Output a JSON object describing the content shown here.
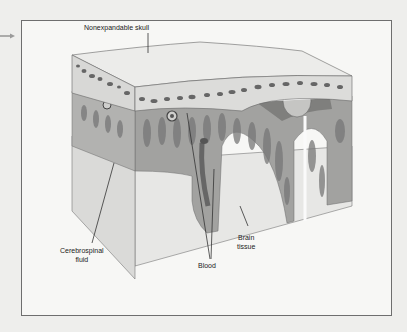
{
  "figure": {
    "type": "anatomical cross-section illustration",
    "labels": {
      "skull": "Nonexpandable skull",
      "csf_line1": "Cerebrospinal",
      "csf_line2": "fluid",
      "blood": "Blood",
      "brain_line1": "Brain",
      "brain_line2": "tissue"
    }
  },
  "colors": {
    "page_background": "#eeeeec",
    "box_background": "#f7f7f5",
    "border": "#6e6e6e",
    "skull_top": "#e9e9e7",
    "skull_side": "#d6d6d4",
    "marrow_spots": "#6a6a6a",
    "meninges": "#a9a9a7",
    "csf_gray": "#9b9b99",
    "brain_tissue": "#e6e6e4",
    "text": "#222222"
  }
}
